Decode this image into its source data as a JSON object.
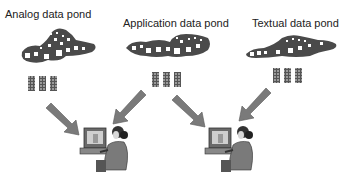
{
  "ponds": [
    {
      "label": "Analog data pond"
    },
    {
      "label": "Application data pond"
    },
    {
      "label": "Textual data pond"
    }
  ],
  "colors": {
    "pond": "#4a4a4a",
    "arrow": "#7a7a7a",
    "data_block": "#888888"
  }
}
